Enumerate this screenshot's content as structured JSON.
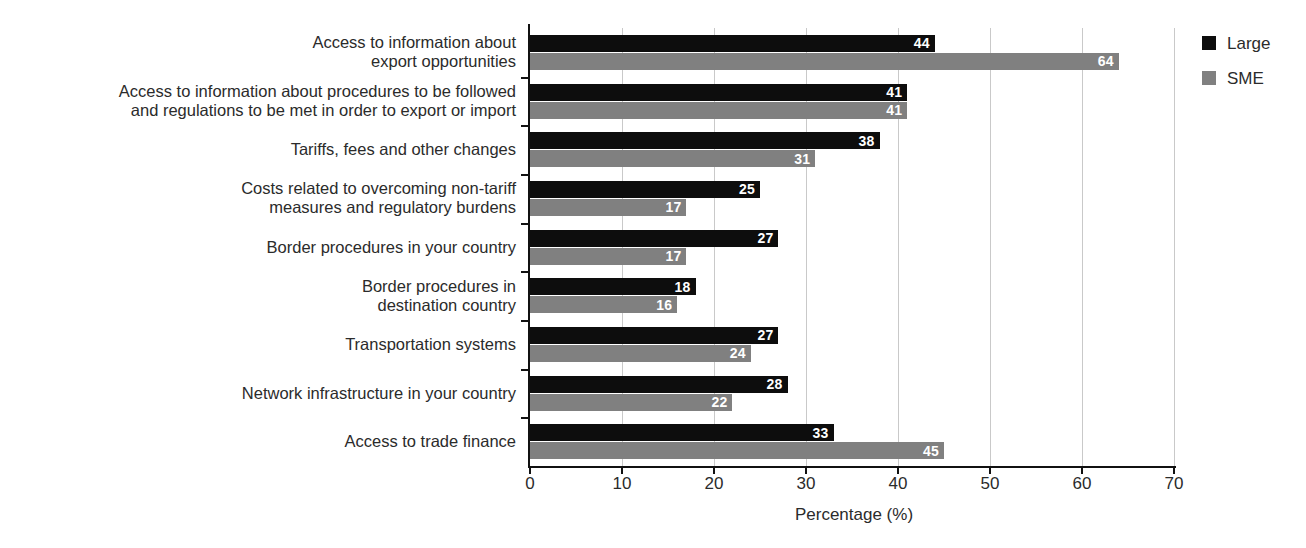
{
  "chart_data": {
    "type": "bar",
    "orientation": "horizontal",
    "title": "",
    "xlabel": "Percentage (%)",
    "ylabel": "",
    "xlim": [
      0,
      70
    ],
    "xticks": [
      0,
      10,
      20,
      30,
      40,
      50,
      60,
      70
    ],
    "grid": true,
    "grid_axis": "x",
    "legend_position": "right",
    "categories": [
      "Access to information about\nexport opportunities",
      "Access to information about procedures to be followed\nand regulations to be met in order to export or import",
      "Tariffs, fees and other changes",
      "Costs related to overcoming non-tariff\nmeasures and regulatory burdens",
      "Border procedures in your country",
      "Border procedures in\ndestination country",
      "Transportation systems",
      "Network infrastructure in your country",
      "Access to trade finance"
    ],
    "series": [
      {
        "name": "Large",
        "color": "#0d0d0d",
        "values": [
          44,
          41,
          38,
          25,
          27,
          18,
          27,
          28,
          33
        ]
      },
      {
        "name": "SME",
        "color": "#808080",
        "values": [
          64,
          41,
          31,
          17,
          17,
          16,
          24,
          22,
          45
        ]
      }
    ]
  },
  "legend": {
    "items": [
      {
        "label": "Large",
        "color": "#0d0d0d"
      },
      {
        "label": "SME",
        "color": "#808080"
      }
    ]
  }
}
